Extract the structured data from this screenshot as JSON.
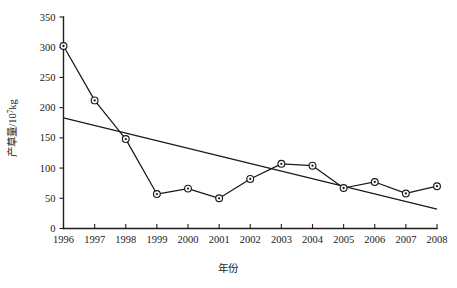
{
  "chart_data": {
    "type": "line",
    "title": "",
    "xlabel": "年份",
    "ylabel": "产草量/10",
    "ylabel_exponent": "7",
    "ylabel_unit": "kg",
    "ylabel_full": "产草量/10⁷kg",
    "x": [
      1996,
      1997,
      1998,
      1999,
      2000,
      2001,
      2002,
      2003,
      2004,
      2005,
      2006,
      2007,
      2008
    ],
    "xticklabels": [
      "1996",
      "1997",
      "1998",
      "1999",
      "2000",
      "2001",
      "2002",
      "2003",
      "2004",
      "2005",
      "2006",
      "2007",
      "2008"
    ],
    "yticks": [
      0,
      50,
      100,
      150,
      200,
      250,
      300,
      350
    ],
    "yticklabels": [
      "0",
      "50",
      "100",
      "150",
      "200",
      "250",
      "300",
      "350"
    ],
    "ylim": [
      0,
      350
    ],
    "xlim": [
      1996,
      2008
    ],
    "grid": false,
    "legend": false,
    "series": [
      {
        "name": "产草量",
        "marker": "circle-dot",
        "color": "#1a1a1a",
        "values": [
          302,
          212,
          148,
          57,
          66,
          50,
          82,
          107,
          104,
          67,
          77,
          58,
          70
        ]
      },
      {
        "name": "线性趋势线",
        "marker": "none",
        "color": "#1a1a1a",
        "type": "trend",
        "endpoints": [
          {
            "x": 1996,
            "y": 183
          },
          {
            "x": 2008,
            "y": 32
          }
        ]
      }
    ]
  },
  "figure": {
    "background": "#ffffff",
    "axis_color": "#1f1f1f"
  }
}
